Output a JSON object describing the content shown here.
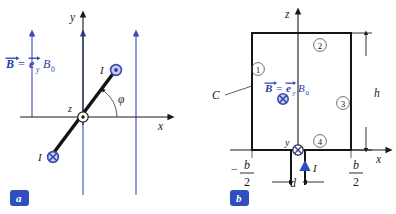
{
  "figure": {
    "panels": [
      {
        "id": "a",
        "badge_label": "a",
        "axes": {
          "x_label": "x",
          "y_label": "y",
          "z_label": "z"
        },
        "field_label": {
          "b_symbol": "B",
          "equals": "=",
          "e_symbol": "e",
          "e_subscript": "y",
          "b_magnitude": "B",
          "b_magnitude_subscript": "0"
        },
        "angle_label": "φ",
        "current_top": {
          "label": "I",
          "direction_icon": "dot-circle-out-of-page"
        },
        "current_bottom": {
          "label": "I",
          "direction_icon": "cross-circle-into-page"
        },
        "origin_icon": "dot-circle-z-axis-out-of-page"
      },
      {
        "id": "b",
        "badge_label": "b",
        "axes": {
          "x_label": "x",
          "z_label": "z",
          "y_label": "y"
        },
        "field_label": {
          "b_symbol": "B",
          "equals": "=",
          "e_symbol": "e",
          "e_subscript": "y",
          "b_magnitude": "B",
          "b_magnitude_subscript": "0"
        },
        "field_direction_icon": "cross-circle-into-page",
        "contour_label": "C",
        "segment_labels": [
          "①",
          "②",
          "③",
          "④"
        ],
        "dimension_height": "h",
        "dimension_gap": "d",
        "dimension_left": {
          "sign": "−",
          "numerator": "b",
          "denominator": "2"
        },
        "dimension_right": {
          "sign": "",
          "numerator": "b",
          "denominator": "2"
        },
        "current_label": "I",
        "origin_icon": "cross-circle-y-axis-into-page"
      }
    ]
  },
  "colors": {
    "accent_blue": "#2f4fc0",
    "field_line_blue": "#3a49b8",
    "symbol_fill_blue": "#c8cdeb",
    "ink": "#1a1a1a",
    "background": "#ffffff"
  }
}
